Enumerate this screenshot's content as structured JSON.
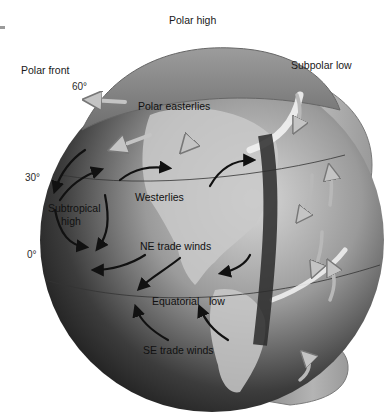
{
  "diagram": {
    "colors": {
      "background": "#ffffff",
      "globe_dark": "#2e2e2e",
      "globe_mid": "#7a7a7a",
      "globe_light": "#c8c8c8",
      "land": "#bdbdbd",
      "cell_shell": "#9e9e9e",
      "arrow_dark": "#111111",
      "arrow_light": "#b0b0b0"
    },
    "outer_labels": {
      "polar_high": "Polar high",
      "polar_front": "Polar front",
      "subpolar_low": "Subpolar low"
    },
    "latitude_labels": {
      "lat60": "60°",
      "lat30": "30°",
      "lat0": "0°"
    },
    "globe_labels": {
      "polar_easterlies": "Polar easterlies",
      "westerlies": "Westerlies",
      "subtropical_high_line1": "Subtropical",
      "subtropical_high_line2": "high",
      "ne_trade_winds": "NE trade winds",
      "equatorial": "Equatorial",
      "low": "low",
      "se_trade_winds": "SE trade winds"
    }
  }
}
